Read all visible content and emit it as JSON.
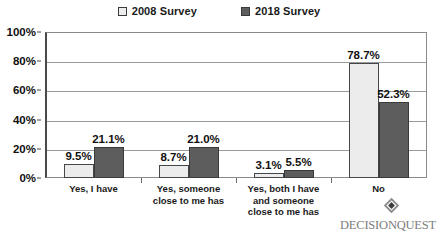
{
  "chart_data": {
    "type": "bar",
    "title": "",
    "subtitle": "",
    "xlabel": "",
    "ylabel": "",
    "ylim": [
      0,
      100
    ],
    "yticks": [
      "0%",
      "20%",
      "40%",
      "60%",
      "80%",
      "100%"
    ],
    "ytick_values": [
      0,
      20,
      40,
      60,
      80,
      100
    ],
    "grid": true,
    "legend_position": "top-center",
    "categories": [
      "Yes, I have",
      "Yes, someone close to me has",
      "Yes, both I have and someone close to me has",
      "No"
    ],
    "category_lines": [
      [
        "Yes, I have"
      ],
      [
        "Yes, someone",
        "close to me has"
      ],
      [
        "Yes, both I have",
        "and someone",
        "close to me has"
      ],
      [
        "No"
      ]
    ],
    "series": [
      {
        "name": "2008 Survey",
        "color": "#ececec",
        "values": [
          9.5,
          8.7,
          3.1,
          78.7
        ],
        "labels": [
          "9.5%",
          "8.7%",
          "3.1%",
          "78.7%"
        ]
      },
      {
        "name": "2018 Survey",
        "color": "#5d5d5d",
        "values": [
          21.1,
          21.0,
          5.5,
          52.3
        ],
        "labels": [
          "21.1%",
          "21.0%",
          "5.5%",
          "52.3%"
        ]
      }
    ]
  },
  "legend": {
    "entries": [
      {
        "label": "2008 Survey",
        "swatch": "light"
      },
      {
        "label": "2018 Survey",
        "swatch": "dark"
      }
    ]
  },
  "branding": {
    "name": "DECISIONQUEST",
    "mark": "diamond-logo-icon"
  }
}
